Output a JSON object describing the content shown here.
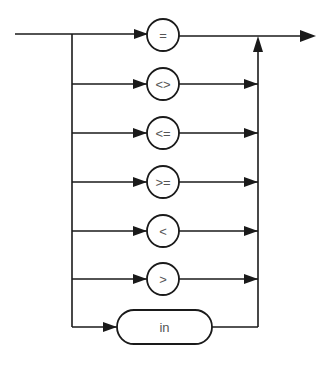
{
  "diagram": {
    "type": "syntax-railroad",
    "operators": [
      {
        "label": "=",
        "shape": "circle",
        "y": 35
      },
      {
        "label": "<>",
        "shape": "circle",
        "y": 84
      },
      {
        "label": "<=",
        "shape": "circle",
        "y": 133
      },
      {
        "label": ">=",
        "shape": "circle",
        "y": 182
      },
      {
        "label": "<",
        "shape": "circle",
        "y": 231
      },
      {
        "label": ">",
        "shape": "circle",
        "y": 279
      },
      {
        "label": "in",
        "shape": "pill",
        "y": 327
      }
    ],
    "colors": {
      "stroke": "#1a1a1a",
      "text": "#555555",
      "background": "#ffffff"
    }
  }
}
